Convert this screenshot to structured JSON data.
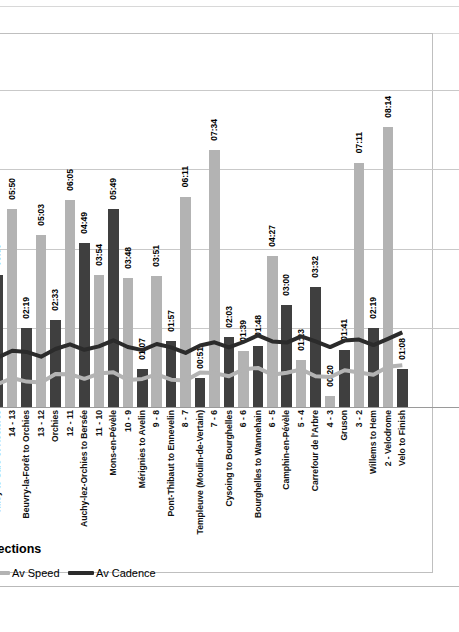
{
  "chart": {
    "title_visible": "erage",
    "title_full": "Cobble Section Average",
    "axis_title_visible": "bble Sections",
    "axis_title_full": "Cobble Sections",
    "accent_speed": "#b3b3b3",
    "accent_cadence": "#2b2b2b",
    "bar_color_even": "#b3b3b3",
    "bar_color_odd": "#3f3f3f",
    "grid_color": "#c9c9c9"
  },
  "legend": {
    "position": "bottom-left",
    "items": [
      {
        "label": "Av Speed",
        "color": "#b3b3b3"
      },
      {
        "label": "Av Cadence",
        "color": "#2b2b2b"
      }
    ]
  },
  "chart_data": {
    "type": "bar",
    "subtitle": "",
    "xlabel": "Cobble Sections",
    "ylabel": "",
    "grid": true,
    "note": "Bars are labelled with elapsed times (mm:ss). Bar value = seconds derived from the mm:ss data label. Two overlay line series (Av Speed, Av Cadence) run across the plot.",
    "categories": [
      "15 - 14",
      "Tilloy to Sars-et-Rosières",
      "14 - 13",
      "Beuvry-la-Forêt to Orchies",
      "13 - 12",
      "Orchies",
      "12 - 11",
      "Auchy-lez-Orchies to Bersée",
      "11 - 10",
      "Mons-en-Pévèle",
      "10 - 9",
      "Mérignies to Avelin",
      "9 - 8",
      "Pont-Thibaut to Ennevelin",
      "8 - 7",
      "Templeuve (Moulin-de-Vertain)",
      "7 - 6",
      "Cysoing to Bourghelles",
      "6 - 6",
      "Bourghelles to Wannehain",
      "6 - 5",
      "Camphin-en-Pévèle",
      "5 - 4",
      "Carrefour de l'Arbre",
      "4 - 3",
      "Gruson",
      "3 - 2",
      "Willems to Hem",
      "2 - Velodrome",
      "Velo to Finish"
    ],
    "labels": [
      "01:35",
      "03:53",
      "05:50",
      "02:19",
      "05:03",
      "02:33",
      "06:05",
      "04:49",
      "03:54",
      "05:49",
      "03:48",
      "01:07",
      "03:51",
      "01:57",
      "06:11",
      "00:51",
      "07:34",
      "02:03",
      "01:39",
      "01:48",
      "04:27",
      "03:00",
      "01:23",
      "03:32",
      "00:20",
      "01:41",
      "07:11",
      "02:19",
      "08:14",
      "01:08"
    ],
    "values_seconds": [
      95,
      233,
      350,
      139,
      303,
      153,
      365,
      289,
      234,
      349,
      228,
      67,
      231,
      117,
      371,
      51,
      454,
      123,
      99,
      108,
      267,
      180,
      83,
      212,
      20,
      101,
      431,
      139,
      494,
      68
    ],
    "series": [
      {
        "name": "Av Speed",
        "kind": "line",
        "color": "#b3b3b3"
      },
      {
        "name": "Av Cadence",
        "kind": "line",
        "color": "#2b2b2b"
      }
    ]
  }
}
